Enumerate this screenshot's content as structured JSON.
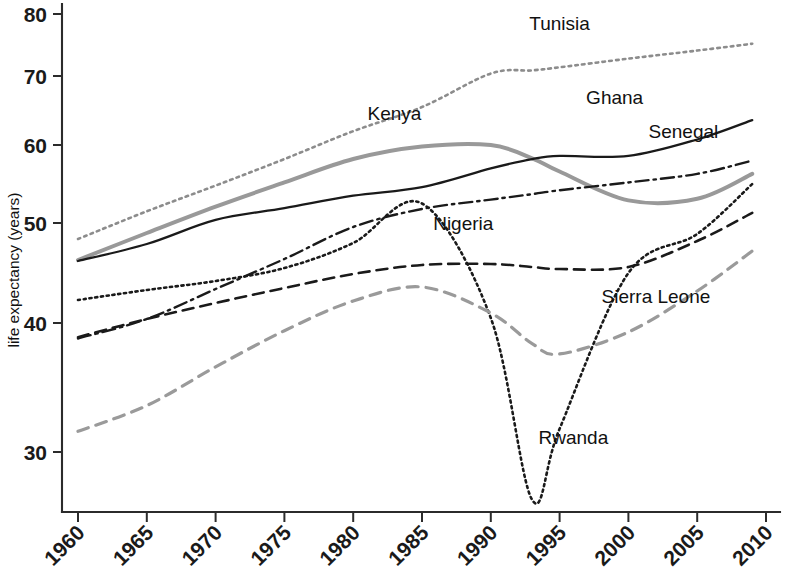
{
  "chart_data": {
    "type": "line",
    "title": "",
    "xlabel": "",
    "ylabel": "life expectancy (years)",
    "xlim": [
      1960,
      2010
    ],
    "ylim": [
      25,
      82
    ],
    "grid": false,
    "legend_position": "inline-labels",
    "x_ticks": [
      1960,
      1965,
      1970,
      1975,
      1980,
      1985,
      1990,
      1995,
      2000,
      2005,
      2010
    ],
    "y_ticks": [
      30,
      40,
      50,
      60,
      70,
      80
    ],
    "x": [
      1960,
      1965,
      1970,
      1975,
      1980,
      1985,
      1990,
      1993,
      1995,
      2000,
      2005,
      2009
    ],
    "series": [
      {
        "name": "Tunisia",
        "style": "dotted",
        "color": "#8c8c8c",
        "label_x": 1995,
        "label_y": 77.5,
        "values": [
          48.4,
          51.5,
          54.8,
          58.2,
          62.0,
          65.5,
          70.4,
          70.9,
          71.4,
          72.8,
          74.1,
          75.2
        ]
      },
      {
        "name": "Kenya",
        "style": "solid-thick",
        "color": "#999999",
        "label_x": 1983,
        "label_y": 63.6,
        "values": [
          46.3,
          49.0,
          52.1,
          55.2,
          58.2,
          59.8,
          60.0,
          58.3,
          56.6,
          52.9,
          53.1,
          56.3
        ]
      },
      {
        "name": "Ghana",
        "style": "solid",
        "color": "#1a1a1a",
        "label_x": 1999,
        "label_y": 66.0,
        "values": [
          46.2,
          47.9,
          50.4,
          51.9,
          53.5,
          54.6,
          57.0,
          58.2,
          58.6,
          58.6,
          60.8,
          63.6
        ]
      },
      {
        "name": "Senegal",
        "style": "dashdot",
        "color": "#1a1a1a",
        "label_x": 2004,
        "label_y": 61.0,
        "values": [
          38.8,
          40.4,
          43.4,
          46.4,
          49.6,
          51.8,
          53.0,
          53.7,
          54.2,
          55.2,
          56.3,
          58.0
        ]
      },
      {
        "name": "Nigeria",
        "style": "dashed",
        "color": "#1a1a1a",
        "label_x": 1988,
        "label_y": 49.3,
        "values": [
          38.9,
          40.4,
          42.0,
          43.5,
          44.9,
          45.8,
          45.9,
          45.6,
          45.4,
          45.6,
          48.2,
          51.3
        ]
      },
      {
        "name": "Rwanda",
        "style": "fine-dotted",
        "color": "#1a1a1a",
        "label_x": 1996,
        "label_y": 30.6,
        "values": [
          42.3,
          43.3,
          44.2,
          45.5,
          48.0,
          52.5,
          40.5,
          26.3,
          31.8,
          45.0,
          48.9,
          55.0
        ]
      },
      {
        "name": "Sierra Leone",
        "style": "dashed-gray",
        "color": "#9a9a9a",
        "label_x": 2002,
        "label_y": 42.0,
        "values": [
          31.6,
          33.6,
          36.6,
          39.4,
          42.2,
          43.6,
          41.0,
          38.4,
          37.6,
          39.3,
          43.2,
          47.2
        ]
      }
    ]
  },
  "axes": {
    "y_axis_title": "life expectancy (years)",
    "y_tick_labels": [
      "80",
      "70",
      "60",
      "50",
      "40",
      "30"
    ],
    "x_tick_labels": [
      "1960",
      "1965",
      "1970",
      "1975",
      "1980",
      "1985",
      "1990",
      "1995",
      "2000",
      "2005",
      "2010"
    ]
  },
  "labels": {
    "tunisia": "Tunisia",
    "kenya": "Kenya",
    "ghana": "Ghana",
    "senegal": "Senegal",
    "nigeria": "Nigeria",
    "rwanda": "Rwanda",
    "sierra_leone": "Sierra Leone"
  }
}
